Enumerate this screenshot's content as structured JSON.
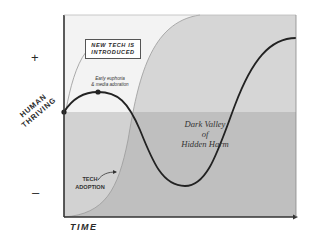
{
  "diagram": {
    "y_axis": {
      "label_line1": "HUMAN",
      "label_line2": "THRIVING",
      "positive_marker": "+",
      "negative_marker": "–"
    },
    "x_axis": {
      "label": "TIME"
    },
    "annotations": {
      "new_tech_line1": "NEW TECH IS",
      "new_tech_line2": "INTRODUCED",
      "euphoria_line1": "Early euphoria",
      "euphoria_line2": "& media adoration",
      "valley_line1": "Dark Valley",
      "valley_line2": "of",
      "valley_line3": "Hidden Harm",
      "adoption_line1": "TECH",
      "adoption_line2": "ADOPTION"
    },
    "colors": {
      "frame": "#333333",
      "upper_background": "#f4f4f4",
      "lower_band": "#cfcfcf",
      "adoption_area": "#bdbdbd",
      "adoption_area_upper": "#d6d6d6",
      "curve": "#222222"
    },
    "curves": [
      {
        "name": "Human thriving",
        "description": "Starts at neutral, rises briefly (early euphoria), falls into dark valley, then rises well above neutral"
      },
      {
        "name": "Tech adoption",
        "description": "S-curve rising from bottom-left to top across time"
      }
    ]
  }
}
